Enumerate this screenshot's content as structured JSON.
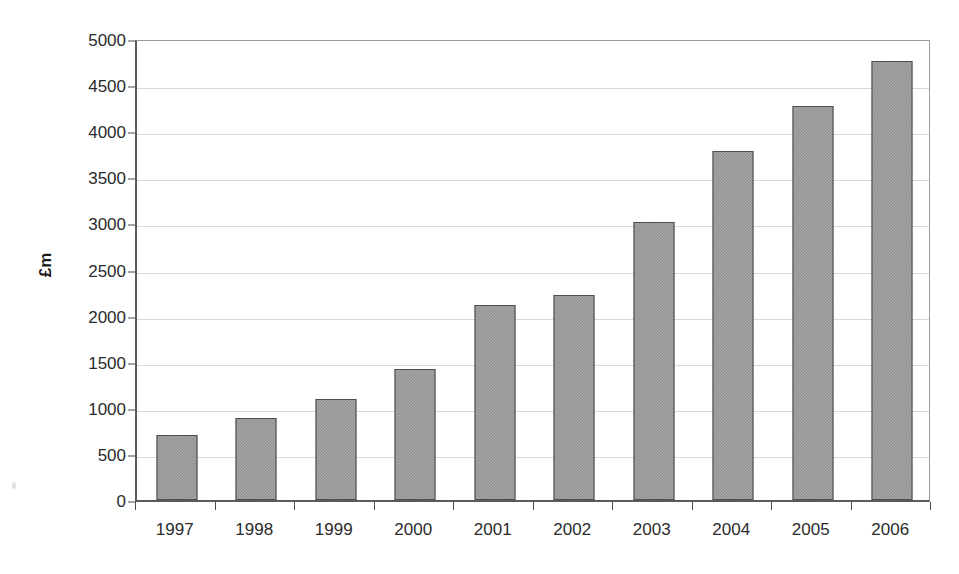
{
  "chart_data": {
    "type": "bar",
    "title": "",
    "xlabel": "",
    "ylabel": "£m",
    "categories": [
      "1997",
      "1998",
      "1999",
      "2000",
      "2001",
      "2002",
      "2003",
      "2004",
      "2005",
      "2006"
    ],
    "values": [
      700,
      890,
      1100,
      1420,
      2110,
      2225,
      3020,
      3785,
      4275,
      4760
    ],
    "ylim": [
      0,
      5000
    ],
    "ytick_labels": [
      "0",
      "500",
      "1000",
      "1500",
      "2000",
      "2500",
      "3000",
      "3500",
      "4000",
      "4500",
      "5000"
    ],
    "ytick_values": [
      0,
      500,
      1000,
      1500,
      2000,
      2500,
      3000,
      3500,
      4000,
      4500,
      5000
    ],
    "ytick_interval": 500,
    "grid": true,
    "legend": false,
    "legend_position": "none",
    "series": [
      {
        "name": "£m",
        "values": [
          700,
          890,
          1100,
          1420,
          2110,
          2225,
          3020,
          3785,
          4275,
          4760
        ],
        "color": "#8d8d8d",
        "border_color": "#4e4e4e",
        "fill_pattern": "cross-hatch"
      }
    ],
    "colors": {
      "bar_fill": "#8d8d8d",
      "bar_border": "#4e4e4e",
      "gridline": "#d9d9d9",
      "axis": "#5a5a5a",
      "text": "#2b2b2b",
      "background": "#ffffff"
    }
  }
}
